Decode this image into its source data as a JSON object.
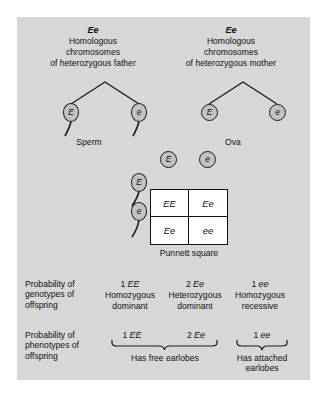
{
  "figure": {
    "background_color": "#d7d7d7",
    "parents": [
      {
        "genotype": "Ee",
        "description_lines": [
          "Homologous",
          "chromosomes",
          "of heterozygous father"
        ],
        "gamete_label": "Sperm",
        "gametes": [
          {
            "allele": "E",
            "type": "sperm"
          },
          {
            "allele": "e",
            "type": "sperm"
          }
        ]
      },
      {
        "genotype": "Ee",
        "description_lines": [
          "Homologous",
          "chromosomes",
          "of heterozygous mother"
        ],
        "gamete_label": "Ova",
        "gametes": [
          {
            "allele": "E",
            "type": "ovum"
          },
          {
            "allele": "e",
            "type": "ovum"
          }
        ]
      }
    ],
    "punnett": {
      "caption": "Punnett square",
      "column_headers": [
        {
          "allele": "E",
          "type": "ovum"
        },
        {
          "allele": "e",
          "type": "ovum"
        }
      ],
      "row_headers": [
        {
          "allele": "E",
          "type": "sperm"
        },
        {
          "allele": "e",
          "type": "sperm"
        }
      ],
      "cells": [
        [
          "EE",
          "Ee"
        ],
        [
          "Ee",
          "ee"
        ]
      ]
    },
    "genotype_row": {
      "label_lines": [
        "Probability of",
        "genotypes of",
        "offspring"
      ],
      "columns": [
        {
          "count": "1",
          "genotype": "EE",
          "description_lines": [
            "Homozygous",
            "dominant"
          ]
        },
        {
          "count": "2",
          "genotype": "Ee",
          "description_lines": [
            "Heterozygous",
            "dominant"
          ]
        },
        {
          "count": "1",
          "genotype": "ee",
          "description_lines": [
            "Homozygous",
            "recessive"
          ]
        }
      ]
    },
    "phenotype_row": {
      "label_lines": [
        "Probability of",
        "phenotypes of",
        "offspring"
      ],
      "groups": [
        {
          "terms": [
            {
              "count": "1",
              "genotype": "EE"
            },
            {
              "count": "2",
              "genotype": "Ee"
            }
          ],
          "description_lines": [
            "Has free earlobes"
          ]
        },
        {
          "terms": [
            {
              "count": "1",
              "genotype": "ee"
            }
          ],
          "description_lines": [
            "Has attached",
            "earlobes"
          ]
        }
      ]
    }
  }
}
